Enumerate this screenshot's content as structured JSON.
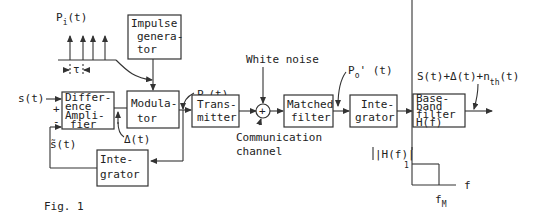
{
  "figure": {
    "caption": "Fig. 1",
    "colors": {
      "ink": "#222222",
      "background": "#ffffff"
    }
  },
  "blocks": {
    "impulse_generator": [
      "Impulse",
      "genera-",
      "tor"
    ],
    "difference_amplifier": [
      "Differ-",
      "ence",
      "Ampli-",
      "fier"
    ],
    "modulator": [
      "Modula-",
      "tor"
    ],
    "transmitter": [
      "Trans-",
      "mitter"
    ],
    "matched_filter": [
      "Matched",
      "filter"
    ],
    "integrator_rx": [
      "Inte-",
      "grator"
    ],
    "baseband_filter": [
      "Base-",
      "band",
      "filter",
      "H(f)"
    ],
    "integrator_fb": [
      "Inte-",
      "grator"
    ],
    "summer_symbol": "+"
  },
  "signals": {
    "pi": {
      "base": "P",
      "sub": "i",
      "tail": "(t)"
    },
    "tau": "τ",
    "po": {
      "base": "P",
      "sub": "o",
      "tail": "(t)"
    },
    "po_prime": {
      "base": "P",
      "sub": "o",
      "tail": "' (t)"
    },
    "s_in": "s(t)",
    "plus": "+",
    "minus": "-",
    "s_tilde": "s̃(t)",
    "delta": "Δ(t)",
    "white_noise": "White noise",
    "channel": [
      "Communication",
      "channel"
    ],
    "output": {
      "main": "S(t)+Δ(t)+n",
      "sub": "th",
      "tail": "(t)"
    }
  },
  "filter_response": {
    "ylabel": "|H(f)|",
    "ytick": "1",
    "xlabel": "f",
    "xtick": {
      "base": "f",
      "sub": "M"
    }
  }
}
